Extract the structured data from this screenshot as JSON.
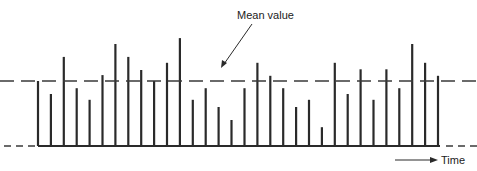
{
  "chart_data": {
    "type": "bar",
    "title": "",
    "annotation": "Mean value",
    "time_label": "Time",
    "xlabel": "Time",
    "ylabel": "",
    "mean_value": 1.0,
    "baseline_value": 0.0,
    "ylim": [
      0,
      1.65
    ],
    "grid": false,
    "legend": "none",
    "colors": {
      "bars": "#2a2a2a",
      "lines": "#3a3a3a",
      "background": "#ffffff"
    },
    "values": [
      1.0,
      0.8,
      1.37,
      0.89,
      0.71,
      1.09,
      1.57,
      1.37,
      1.17,
      1.0,
      1.28,
      1.66,
      0.71,
      0.89,
      0.6,
      0.4,
      0.89,
      1.28,
      1.08,
      0.89,
      0.6,
      0.71,
      0.29,
      1.28,
      0.8,
      1.18,
      0.71,
      1.18,
      0.89,
      1.57,
      1.28,
      1.08
    ]
  }
}
